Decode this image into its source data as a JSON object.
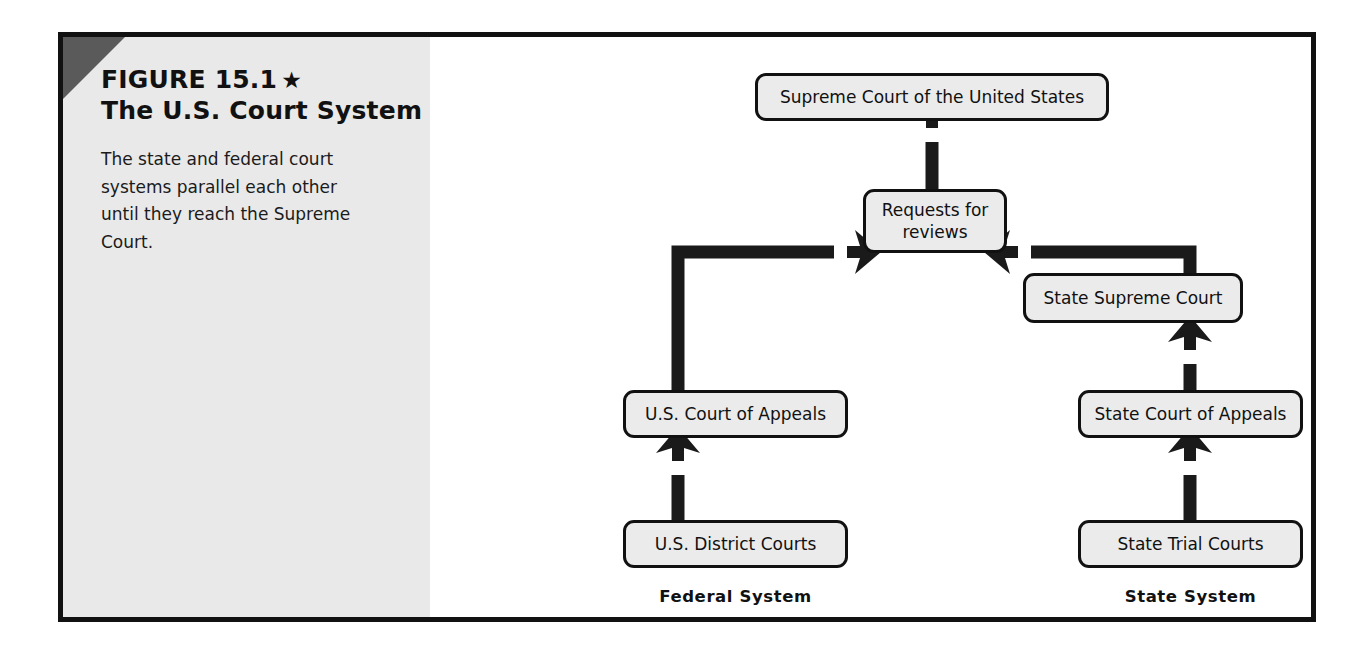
{
  "figure": {
    "title_line1": "FIGURE 15.1",
    "star_glyph": "★",
    "title_line2": "The U.S. Court System",
    "description": "The state and federal court systems parallel each other until they reach the Supreme Court."
  },
  "diagram": {
    "type": "flowchart",
    "nodes": [
      {
        "id": "scotus",
        "label": "Supreme Court of the United States"
      },
      {
        "id": "requests",
        "label": "Requests for reviews"
      },
      {
        "id": "state_supreme",
        "label": "State Supreme Court"
      },
      {
        "id": "us_appeals",
        "label": "U.S. Court of Appeals"
      },
      {
        "id": "state_appeals",
        "label": "State Court of Appeals"
      },
      {
        "id": "us_district",
        "label": "U.S. District Courts"
      },
      {
        "id": "state_trial",
        "label": "State Trial Courts"
      }
    ],
    "edges": [
      {
        "from": "requests",
        "to": "scotus",
        "style": "straight-up"
      },
      {
        "from": "us_appeals",
        "to": "requests",
        "style": "elbow-up-right"
      },
      {
        "from": "state_supreme",
        "to": "requests",
        "style": "elbow-up-left"
      },
      {
        "from": "us_district",
        "to": "us_appeals",
        "style": "straight-up"
      },
      {
        "from": "state_appeals",
        "to": "state_supreme",
        "style": "straight-up"
      },
      {
        "from": "state_trial",
        "to": "state_appeals",
        "style": "straight-up"
      }
    ],
    "column_labels": [
      {
        "id": "federal",
        "label": "Federal System"
      },
      {
        "id": "state",
        "label": "State System"
      }
    ]
  },
  "colors": {
    "frame": "#111111",
    "panel_background": "#e9e9e9",
    "corner_triangle": "#5a5a5a",
    "node_fill": "#ebebeb",
    "node_border": "#111111",
    "arrow": "#1a1a1a",
    "text": "#111111",
    "page_background": "#ffffff"
  }
}
